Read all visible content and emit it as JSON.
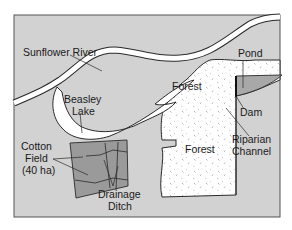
{
  "map": {
    "colors": {
      "background": "#d2d2d2",
      "water": "#ffffff",
      "forest": "#ffffff",
      "cotton_field": "#9a9a9a",
      "pond": "#a8a8a8",
      "outline": "#2a2a2a"
    },
    "labels": {
      "river": "Sunflower River",
      "pond": "Pond",
      "forest_north": "Forest",
      "dam": "Dam",
      "lake_line1": "Beasley",
      "lake_line2": "Lake",
      "riparian_line1": "Riparian",
      "riparian_line2": "Channel",
      "cotton_line1": "Cotton",
      "cotton_line2": "Field",
      "cotton_line3": "(40 ha)",
      "forest_south": "Forest",
      "ditch_line1": "Drainage",
      "ditch_line2": "Ditch"
    }
  }
}
